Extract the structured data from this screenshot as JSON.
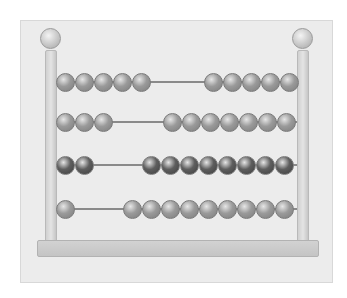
{
  "scene": {
    "subject": "abacus illustration",
    "style": "grayscale watercolor",
    "colors": {
      "paper": "#ececec",
      "frame": "#d0d0d0",
      "rod": "#8a8a8a",
      "bead_light": "#9a9a9a",
      "bead_dark": "#5e5e5e"
    }
  },
  "rows": [
    {
      "y": 82,
      "left_count": 5,
      "right_count": 5,
      "left_start": 65,
      "right_start": 213,
      "shade": "light"
    },
    {
      "y": 122,
      "left_count": 3,
      "right_count": 7,
      "left_start": 65,
      "right_start": 172,
      "shade": "light"
    },
    {
      "y": 165,
      "left_count": 2,
      "right_count": 8,
      "left_start": 65,
      "right_start": 151,
      "shade": "dark"
    },
    {
      "y": 209,
      "left_count": 1,
      "right_count": 9,
      "left_start": 65,
      "right_start": 132,
      "shade": "light"
    }
  ]
}
